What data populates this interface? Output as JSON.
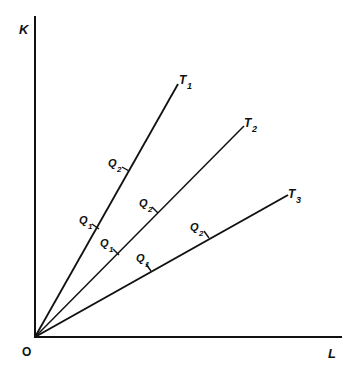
{
  "diagram": {
    "type": "technique-rays",
    "axes": {
      "y_label": "K",
      "x_label": "L",
      "origin_label": "O",
      "color": "#111111"
    },
    "rays": [
      {
        "label": "T",
        "subscript": "1",
        "marks": [
          {
            "label": "Q",
            "subscript": "1"
          },
          {
            "label": "Q",
            "subscript": "2"
          }
        ]
      },
      {
        "label": "T",
        "subscript": "2",
        "marks": [
          {
            "label": "Q",
            "subscript": "1"
          },
          {
            "label": "Q",
            "subscript": "2"
          }
        ]
      },
      {
        "label": "T",
        "subscript": "3",
        "marks": [
          {
            "label": "Q",
            "subscript": "1"
          },
          {
            "label": "Q",
            "subscript": "2"
          }
        ]
      }
    ]
  }
}
